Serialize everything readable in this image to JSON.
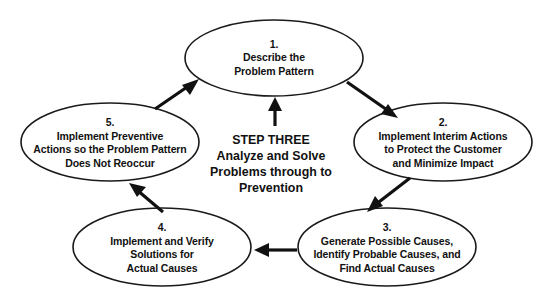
{
  "diagram": {
    "title": "STEP THREE Analyze and Solve Problems through to Prevention",
    "type": "cycle",
    "center": {
      "lines": [
        "STEP THREE",
        "Analyze and Solve",
        "Problems through to",
        "Prevention"
      ]
    },
    "nodes": [
      {
        "number": "1.",
        "lines": [
          "Describe the",
          "Problem Pattern"
        ]
      },
      {
        "number": "2.",
        "lines": [
          "Implement Interim Actions",
          "to Protect the Customer",
          "and Minimize Impact"
        ]
      },
      {
        "number": "3.",
        "lines": [
          "Generate Possible Causes,",
          "Identify Probable Causes, and",
          "Find Actual Causes"
        ]
      },
      {
        "number": "4.",
        "lines": [
          "Implement and Verify",
          "Solutions for",
          "Actual Causes"
        ]
      },
      {
        "number": "5.",
        "lines": [
          "Implement Preventive",
          "Actions so the Problem Pattern",
          "Does Not Reoccur"
        ]
      }
    ],
    "connectors": [
      {
        "from": "1",
        "to": "2",
        "direction": "down-right"
      },
      {
        "from": "2",
        "to": "3",
        "direction": "down-left"
      },
      {
        "from": "3",
        "to": "4",
        "direction": "left"
      },
      {
        "from": "4",
        "to": "5",
        "direction": "up-left"
      },
      {
        "from": "5",
        "to": "1",
        "direction": "up-right"
      },
      {
        "from": "center",
        "to": "1",
        "direction": "up"
      }
    ],
    "colors": {
      "stroke": "#1a1a1a",
      "arrow": "#111111",
      "text": "#111111",
      "background": "#ffffff"
    }
  }
}
